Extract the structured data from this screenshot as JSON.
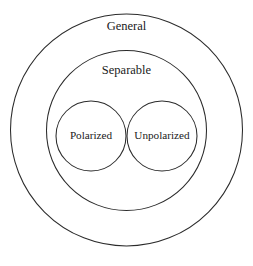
{
  "diagram": {
    "type": "nested-set-venn",
    "title_text": "",
    "background_color": "#ffffff",
    "stroke_color": "#2b2b2b",
    "text_color": "#1a1a1a",
    "sets": [
      {
        "id": "general",
        "label": "General",
        "shape": "circle",
        "cx": 126.5,
        "cy": 130.0,
        "r": 116.0,
        "label_x": 126.5,
        "label_y": 27.0,
        "label_size": 12.5,
        "level": 0
      },
      {
        "id": "separable",
        "label": "Separable",
        "shape": "circle",
        "cx": 126.5,
        "cy": 130.5,
        "r": 80.0,
        "label_x": 126.5,
        "label_y": 71.0,
        "label_size": 12.5,
        "level": 1
      },
      {
        "id": "polarized",
        "label": "Polarized",
        "shape": "circle",
        "cx": 91.0,
        "cy": 136.0,
        "r": 35.0,
        "label_x": 91.0,
        "label_y": 136.5,
        "label_size": 11.2,
        "level": 2
      },
      {
        "id": "unpolarized",
        "label": "Unpolarized",
        "shape": "circle",
        "cx": 162.0,
        "cy": 136.0,
        "r": 35.0,
        "label_x": 162.0,
        "label_y": 136.5,
        "label_size": 11.2,
        "level": 2
      }
    ]
  },
  "chart_data": {
    "type": "diagram",
    "subtype": "euler-nested-circles",
    "title": "",
    "categories": [
      "General",
      "Separable",
      "Polarized",
      "Unpolarized"
    ],
    "containment": [
      {
        "parent": "General",
        "child": "Separable"
      },
      {
        "parent": "Separable",
        "child": "Polarized"
      },
      {
        "parent": "Separable",
        "child": "Unpolarized"
      }
    ],
    "siblings": [
      [
        "Polarized",
        "Unpolarized"
      ]
    ],
    "legend": "none",
    "grid": false
  }
}
